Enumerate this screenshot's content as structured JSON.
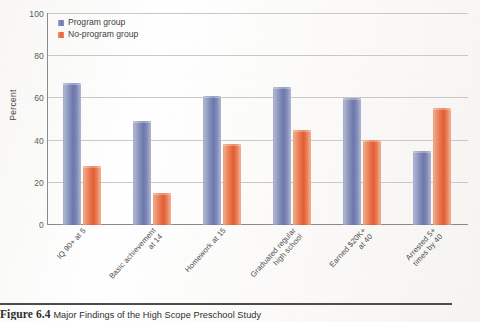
{
  "figure": {
    "caption_label": "Figure 6.4",
    "caption_text": "Major Findings of the High Scope Preschool Study"
  },
  "legend": {
    "items": [
      {
        "label": "Program group",
        "color": "#6d79ae",
        "icon": "legend-swatch"
      },
      {
        "label": "No-program group",
        "color": "#e25f35",
        "icon": "legend-swatch"
      }
    ]
  },
  "axes": {
    "y_label": "Percent",
    "y_ticks": [
      "0",
      "20",
      "40",
      "60",
      "80",
      "100"
    ]
  },
  "chart_data": {
    "type": "bar",
    "title": "Major Findings of the High Scope Preschool Study",
    "xlabel": "",
    "ylabel": "Percent",
    "ylim": [
      0,
      100
    ],
    "grid": true,
    "legend_position": "top-left inside plot",
    "categories": [
      "IQ 90+ at 5",
      "Basic achievement at 14",
      "Homework at 15",
      "Graduated regular high school",
      "Earned $20K+ at 40",
      "Arrested 5+ times by 40"
    ],
    "category_lines": [
      [
        "IQ 90+ at 5"
      ],
      [
        "Basic achievement",
        "at 14"
      ],
      [
        "Homework at 15"
      ],
      [
        "Graduated regular",
        "high school"
      ],
      [
        "Earned $20K+",
        "at 40"
      ],
      [
        "Arrested 5+",
        "times by 40"
      ]
    ],
    "series": [
      {
        "name": "Program group",
        "color": "#6d79ae",
        "values": [
          67,
          49,
          61,
          65,
          60,
          35
        ]
      },
      {
        "name": "No-program group",
        "color": "#e25f35",
        "values": [
          28,
          15,
          38,
          45,
          40,
          55
        ]
      }
    ]
  }
}
